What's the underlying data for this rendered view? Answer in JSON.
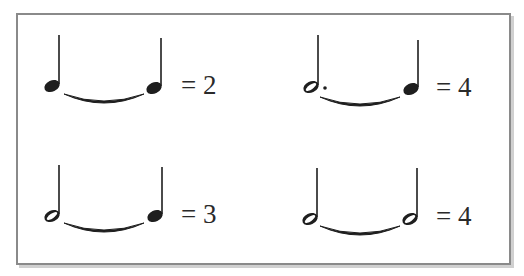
{
  "figure": {
    "title": "",
    "frame": {
      "border_color": "#8a8a8a",
      "shadow_color": "#d0d0d0"
    },
    "examples": [
      {
        "id": "quarter-tied-quarter",
        "notes": [
          "quarter",
          "quarter"
        ],
        "tied": true,
        "equals": "=",
        "value": "2",
        "label": "= 2"
      },
      {
        "id": "dotted-half-tied-quarter",
        "notes": [
          "dotted-half",
          "quarter"
        ],
        "tied": true,
        "equals": "=",
        "value": "4",
        "label": "= 4"
      },
      {
        "id": "half-tied-quarter",
        "notes": [
          "half",
          "quarter"
        ],
        "tied": true,
        "equals": "=",
        "value": "3",
        "label": "= 3"
      },
      {
        "id": "half-tied-half",
        "notes": [
          "half",
          "half"
        ],
        "tied": true,
        "equals": "=",
        "value": "4",
        "label": "= 4"
      }
    ],
    "note_color": "#1e1e1e"
  }
}
